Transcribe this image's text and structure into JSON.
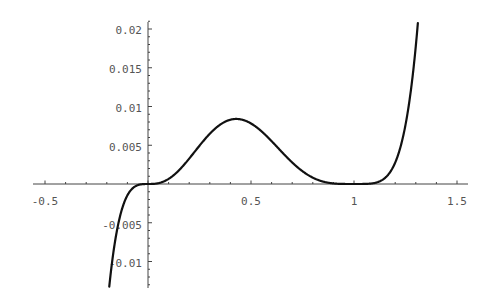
{
  "chart_data": {
    "type": "line",
    "title": "",
    "xlabel": "",
    "ylabel": "",
    "function": "x^3 (x-1)^4",
    "xlim": [
      -0.55,
      1.55
    ],
    "ylim": [
      -0.0135,
      0.021
    ],
    "grid": false,
    "legend": null,
    "x_ticks": [
      "-0.5",
      "0.5",
      "1",
      "1.5"
    ],
    "y_ticks": [
      "0.02",
      "0.015",
      "0.01",
      "0.005",
      "-0.005",
      "-0.01"
    ],
    "x": [
      -0.19,
      -0.15,
      -0.1,
      -0.05,
      0,
      0.1,
      0.2,
      0.3,
      0.4,
      0.43,
      0.5,
      0.6,
      0.7,
      0.8,
      0.9,
      1.0,
      1.1,
      1.2,
      1.25,
      1.3,
      1.31
    ],
    "values": [
      -0.0138,
      -0.0045,
      -0.0015,
      -0.0002,
      0,
      0.00066,
      0.00328,
      0.00648,
      0.00829,
      0.0084,
      0.0078,
      0.0055,
      0.0028,
      0.00082,
      7e-05,
      0,
      0.00013,
      0.00276,
      0.0076,
      0.0178,
      0.0201
    ],
    "colors": {
      "line": "#111111",
      "axis": "#444444",
      "text": "#555555"
    }
  }
}
